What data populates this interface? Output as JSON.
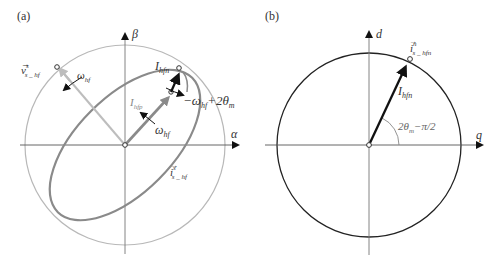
{
  "panel_a": {
    "label": "(a)",
    "axis_x": "α",
    "axis_y": "β",
    "voltage_vector": {
      "symbol": "v",
      "sup": "s",
      "sub": "s _ hf"
    },
    "current_vector": {
      "symbol": "i",
      "sup": "s",
      "sub": "s _ hf"
    },
    "omega_left": {
      "main": "ω",
      "sub": "hf"
    },
    "omega_center": {
      "main": "ω",
      "sub": "hf"
    },
    "I_hfn": {
      "main": "I",
      "sub": "hfn"
    },
    "I_hfp": {
      "main": "I",
      "sub": "hfp"
    },
    "neg_rotation": {
      "prefix": "−ω",
      "sub": "hf",
      "mid": "+2θ",
      "sub2": "m"
    }
  },
  "panel_b": {
    "label": "(b)",
    "axis_x": "q",
    "axis_y": "d",
    "current_vector": {
      "symbol": "i",
      "sup": "n",
      "sub": "s _ hfn"
    },
    "I_hfn": {
      "main": "I",
      "sub": "hfn"
    },
    "angle": {
      "pre": "2θ",
      "sub": "m",
      "post": "−π/2"
    }
  },
  "colors": {
    "light_gray": "#b8b8b8",
    "mid_gray": "#8a8a8a",
    "dark": "#1a1a1a"
  }
}
